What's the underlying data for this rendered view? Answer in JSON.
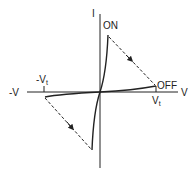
{
  "diagram": {
    "type": "I-V switching hysteresis characteristic",
    "axes": {
      "y_label": "I",
      "x_pos_label": "V",
      "x_neg_label": "-V"
    },
    "ticks": {
      "neg_threshold": {
        "main": "-V",
        "sub": "t"
      },
      "pos_threshold": {
        "main": "V",
        "sub": "t"
      }
    },
    "states": {
      "on": "ON",
      "off": "OFF"
    },
    "colors": {
      "line": "#222222",
      "background": "#ffffff"
    }
  }
}
